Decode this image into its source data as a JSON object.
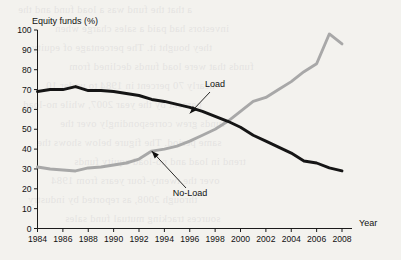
{
  "chart_data": {
    "type": "line",
    "title": "",
    "subtitle": "",
    "ylabel": "Equity funds (%)",
    "xlabel": "Year",
    "x": [
      1984,
      1985,
      1986,
      1987,
      1988,
      1989,
      1990,
      1991,
      1992,
      1993,
      1994,
      1995,
      1996,
      1997,
      1998,
      1999,
      2000,
      2001,
      2002,
      2003,
      2004,
      2005,
      2006,
      2007,
      2008
    ],
    "xlim": [
      1984,
      2008
    ],
    "ylim": [
      0,
      100
    ],
    "xticks": [
      1984,
      1986,
      1988,
      1990,
      1992,
      1994,
      1996,
      1998,
      2000,
      2002,
      2004,
      2006,
      2008
    ],
    "yticks": [
      0,
      10,
      20,
      30,
      40,
      50,
      60,
      70,
      80,
      90,
      100
    ],
    "xtick_labels": [
      "1984",
      "1986",
      "1988",
      "1990",
      "1992",
      "1994",
      "1996",
      "1998",
      "2000",
      "2002",
      "2004",
      "2006",
      "2008"
    ],
    "ytick_labels": [
      "0",
      "10",
      "20",
      "30",
      "40",
      "50",
      "60",
      "70",
      "80",
      "90",
      "100"
    ],
    "grid": false,
    "legend": "annotations",
    "series": [
      {
        "name": "Load",
        "color": "#151515",
        "values": [
          69,
          70,
          70,
          71.5,
          69.5,
          69.5,
          69,
          68,
          67,
          65,
          64,
          62.5,
          61,
          59,
          56.5,
          54,
          51,
          47,
          44,
          41,
          38,
          34,
          33,
          30.5,
          29
        ]
      },
      {
        "name": "No-Load",
        "color": "#a8a8a8",
        "values": [
          31,
          30,
          29.5,
          29,
          30.5,
          31,
          32,
          33,
          35,
          39,
          40,
          41.5,
          44,
          47,
          50,
          54,
          59,
          64,
          66,
          70,
          74,
          79,
          83,
          98,
          93
        ]
      }
    ],
    "annotations": [
      {
        "label": "Load",
        "target_year": 1996,
        "target_value": 58
      },
      {
        "label": "No-Load",
        "target_year": 1993,
        "target_value": 39
      }
    ]
  },
  "background_bleed": [
    "a that the fund was a load fund and the",
    "investors had paid a sales charge when",
    "they bought it. The percentage of equity",
    "funds that were load funds declined from",
    "nearly 70 percent in 1984 to under 10",
    "percent by the year 2007, while no-load",
    "funds grew correspondingly over the",
    "same period. The figure below shows the",
    "trend in load and no-load equity funds",
    "over the twenty-four years from 1984",
    "through 2008, as reported by industry",
    "sources tracking mutual fund sales"
  ]
}
